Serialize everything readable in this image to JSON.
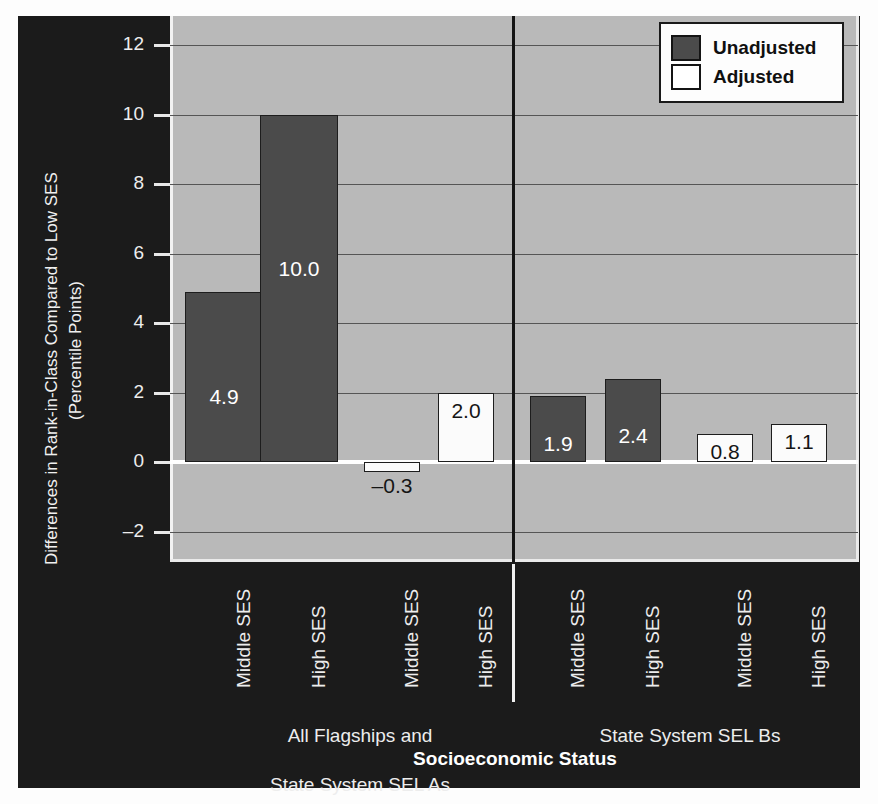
{
  "chart_data": {
    "type": "bar",
    "title": "",
    "xlabel": "Socioeconomic Status",
    "ylabel": "Differences in Rank-in-Class Compared to Low SES\n(Percentile Points)",
    "ylabel_lines": [
      "Differences in Rank-in-Class Compared to Low SES",
      "(Percentile Points)"
    ],
    "ylim": [
      -3.0,
      13.0
    ],
    "yticks": [
      12,
      10,
      8,
      6,
      4,
      2,
      0,
      -2
    ],
    "ytick_labels": [
      "12",
      "10",
      "8",
      "6",
      "4",
      "2",
      "0",
      "–2"
    ],
    "grid": true,
    "legend_position": "top-right",
    "categories": [
      "Middle SES",
      "High SES",
      "Middle SES",
      "High SES",
      "Middle SES",
      "High SES",
      "Middle SES",
      "High SES"
    ],
    "groups": [
      {
        "label": "All Flagships and\nState System SEL As",
        "line1": "All Flagships and",
        "line2": "State System SEL As"
      },
      {
        "label": "State System SEL Bs",
        "line1": "State System SEL Bs",
        "line2": ""
      }
    ],
    "series": [
      {
        "name": "Unadjusted",
        "color": "#4b4b4b",
        "values": [
          4.9,
          10.0,
          null,
          null,
          1.9,
          2.4,
          null,
          null
        ]
      },
      {
        "name": "Adjusted",
        "color": "#ffffff",
        "values": [
          null,
          null,
          -0.3,
          2.0,
          null,
          null,
          0.8,
          1.1
        ]
      }
    ],
    "bars": [
      {
        "category": "Middle SES",
        "group": "All Flagships and State System SEL As",
        "series": "Unadjusted",
        "value": 4.9,
        "label": "4.9",
        "fill": "dark"
      },
      {
        "category": "High SES",
        "group": "All Flagships and State System SEL As",
        "series": "Unadjusted",
        "value": 10.0,
        "label": "10.0",
        "fill": "dark"
      },
      {
        "category": "Middle SES",
        "group": "All Flagships and State System SEL As",
        "series": "Adjusted",
        "value": -0.3,
        "label": "–0.3",
        "fill": "light"
      },
      {
        "category": "High SES",
        "group": "All Flagships and State System SEL As",
        "series": "Adjusted",
        "value": 2.0,
        "label": "2.0",
        "fill": "light"
      },
      {
        "category": "Middle SES",
        "group": "State System SEL Bs",
        "series": "Unadjusted",
        "value": 1.9,
        "label": "1.9",
        "fill": "dark"
      },
      {
        "category": "High SES",
        "group": "State System SEL Bs",
        "series": "Unadjusted",
        "value": 2.4,
        "label": "2.4",
        "fill": "dark"
      },
      {
        "category": "Middle SES",
        "group": "State System SEL Bs",
        "series": "Adjusted",
        "value": 0.8,
        "label": "0.8",
        "fill": "light"
      },
      {
        "category": "High SES",
        "group": "State System SEL Bs",
        "series": "Adjusted",
        "value": 1.1,
        "label": "1.1",
        "fill": "light"
      }
    ],
    "legend": [
      {
        "label": "Unadjusted",
        "swatch": "dark"
      },
      {
        "label": "Adjusted",
        "swatch": "light"
      }
    ],
    "colors": {
      "panel_background": "#1b1b1b",
      "plot_background": "#b9b9b9",
      "bar_unadjusted": "#4b4b4b",
      "bar_adjusted": "#ffffff",
      "gridline": "#555555",
      "zero_line": "#ffffff",
      "text_light": "#ededed",
      "text_dark": "#101010"
    }
  }
}
